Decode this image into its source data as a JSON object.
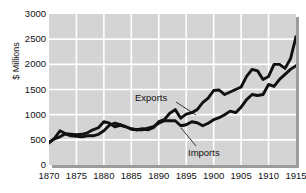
{
  "chart_data": {
    "type": "line",
    "title": "",
    "xlabel": "",
    "ylabel": "$ Millions",
    "xlim": [
      1870,
      1915
    ],
    "ylim": [
      0,
      3000
    ],
    "grid": true,
    "legend_position": "inline-annotations",
    "xticks": [
      1870,
      1875,
      1880,
      1885,
      1890,
      1895,
      1900,
      1905,
      1910,
      1915
    ],
    "yticks": [
      0,
      500,
      1000,
      1500,
      2000,
      2500,
      3000
    ],
    "x": [
      1870,
      1871,
      1872,
      1873,
      1874,
      1875,
      1876,
      1877,
      1878,
      1879,
      1880,
      1881,
      1882,
      1883,
      1884,
      1885,
      1886,
      1887,
      1888,
      1889,
      1890,
      1891,
      1892,
      1893,
      1894,
      1895,
      1896,
      1897,
      1898,
      1899,
      1900,
      1901,
      1902,
      1903,
      1904,
      1905,
      1906,
      1907,
      1908,
      1909,
      1910,
      1911,
      1912,
      1913,
      1914,
      1915
    ],
    "series": [
      {
        "name": "Exports",
        "color": "#111111",
        "values": [
          452,
          520,
          560,
          620,
          610,
          600,
          610,
          640,
          700,
          740,
          860,
          830,
          760,
          790,
          760,
          710,
          700,
          720,
          700,
          740,
          860,
          900,
          1030,
          1100,
          930,
          1010,
          1040,
          1100,
          1240,
          1330,
          1480,
          1490,
          1400,
          1450,
          1500,
          1550,
          1760,
          1900,
          1870,
          1700,
          1760,
          2000,
          2000,
          1920,
          2110,
          2550
        ]
      },
      {
        "name": "Imports",
        "color": "#111111",
        "values": [
          440,
          530,
          680,
          620,
          580,
          570,
          560,
          580,
          580,
          610,
          680,
          790,
          830,
          800,
          760,
          720,
          700,
          700,
          730,
          760,
          830,
          880,
          880,
          880,
          780,
          800,
          860,
          840,
          780,
          830,
          900,
          940,
          1000,
          1070,
          1040,
          1150,
          1300,
          1400,
          1380,
          1400,
          1600,
          1560,
          1700,
          1800,
          1900,
          1970
        ]
      }
    ],
    "annotations": [
      {
        "text": "Exports",
        "series": "Exports"
      },
      {
        "text": "Imports",
        "series": "Imports"
      }
    ]
  },
  "colors": {
    "plot_background": "#d4d4d4",
    "gridline": "#ffffff",
    "line": "#111111",
    "text": "#111111",
    "page_background": "#ffffff"
  }
}
